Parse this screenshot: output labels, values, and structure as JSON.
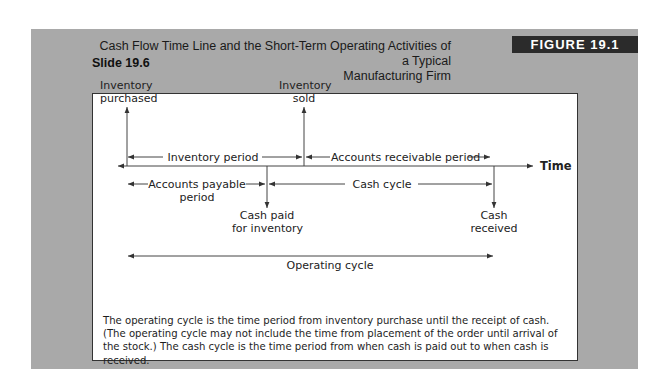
{
  "header": {
    "title_line1": "Cash Flow Time Line and the Short-Term Operating Activities of a Typical",
    "title_line2": "Manufacturing Firm",
    "slide_number": "Slide 19.6",
    "figure_badge": "FIGURE 19.1"
  },
  "diagram": {
    "axis_label": "Time",
    "events": {
      "inventory_purchased": [
        "Inventory",
        "purchased"
      ],
      "inventory_sold": [
        "Inventory",
        "sold"
      ],
      "cash_paid": [
        "Cash paid",
        "for inventory"
      ],
      "cash_received": [
        "Cash",
        "received"
      ]
    },
    "periods": {
      "inventory_period": "Inventory period",
      "accounts_receivable_period": "Accounts receivable period",
      "accounts_payable_period": [
        "Accounts payable",
        "period"
      ],
      "cash_cycle": "Cash cycle",
      "operating_cycle": "Operating cycle"
    },
    "colors": {
      "line": "#444444",
      "background_gray": "#a9a9a9",
      "badge": "#2b2b2b"
    }
  },
  "caption": "The operating cycle is the time period from inventory purchase until the receipt of cash. (The operating cycle may not include the time from placement of the order until arrival of the stock.) The cash cycle is the time period from when cash is paid out to when cash is received."
}
